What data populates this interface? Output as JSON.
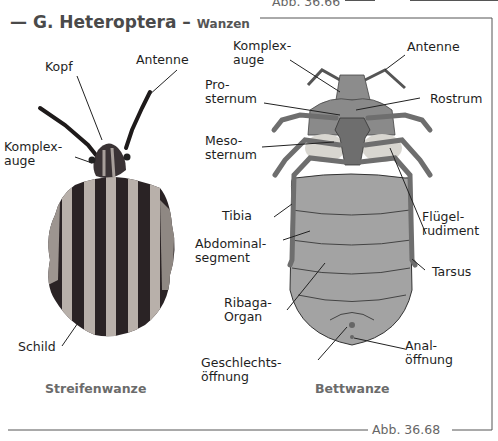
{
  "header": {
    "prev_figure_ref": "Abb. 36.66",
    "title_main": "G. Heteroptera",
    "title_dash": " – ",
    "title_sub": "Wanzen"
  },
  "left_figure": {
    "caption": "Streifenwanze",
    "labels": {
      "kopf": "Kopf",
      "antenne": "Antenne",
      "komplexauge": "Komplex-\nauge",
      "schild": "Schild"
    }
  },
  "right_figure": {
    "caption": "Bettwanze",
    "labels": {
      "komplexauge": "Komplex-\nauge",
      "antenne": "Antenne",
      "prosternum": "Pro-\nsternum",
      "rostrum": "Rostrum",
      "mesosternum": "Meso-\nsternum",
      "tibia": "Tibia",
      "fluegelrudiment": "Flügel-\nrudiment",
      "abdominalsegment": "Abdominal-\nsegment",
      "tarsus": "Tarsus",
      "ribaga": "Ribaga-\nOrgan",
      "geschlecht": "Geschlechts-\nöffnung",
      "anal": "Anal-\nöffnung"
    }
  },
  "footer": {
    "figure_ref": "Abb. 36.68"
  },
  "colors": {
    "title": "#4a4a4a",
    "frame": "#555555",
    "bug_dark": "#2a2325",
    "bug_light": "#b8b0aa",
    "bedbug_body": "#9a9a9a",
    "bedbug_legs": "#6e6e6e"
  }
}
